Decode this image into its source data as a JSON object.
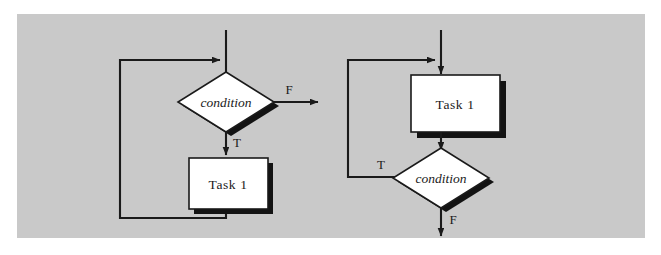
{
  "figure": {
    "background_color": "#c9c9c9",
    "page_color": "#ffffff",
    "ink_color": "#1a1a1a",
    "shape_fill_color": "#ffffff",
    "shadow_color": "#131313"
  },
  "diagrams": [
    {
      "id": "while-loop",
      "nodes": [
        {
          "name": "decision",
          "shape": "diamond",
          "label": "condition"
        },
        {
          "name": "process",
          "shape": "rectangle",
          "label": "Task 1"
        }
      ],
      "edge_labels": {
        "false_branch": "F",
        "true_branch": "T"
      }
    },
    {
      "id": "do-while-loop",
      "nodes": [
        {
          "name": "process",
          "shape": "rectangle",
          "label": "Task 1"
        },
        {
          "name": "decision",
          "shape": "diamond",
          "label": "condition"
        }
      ],
      "edge_labels": {
        "true_branch": "T",
        "false_branch": "F"
      }
    }
  ]
}
